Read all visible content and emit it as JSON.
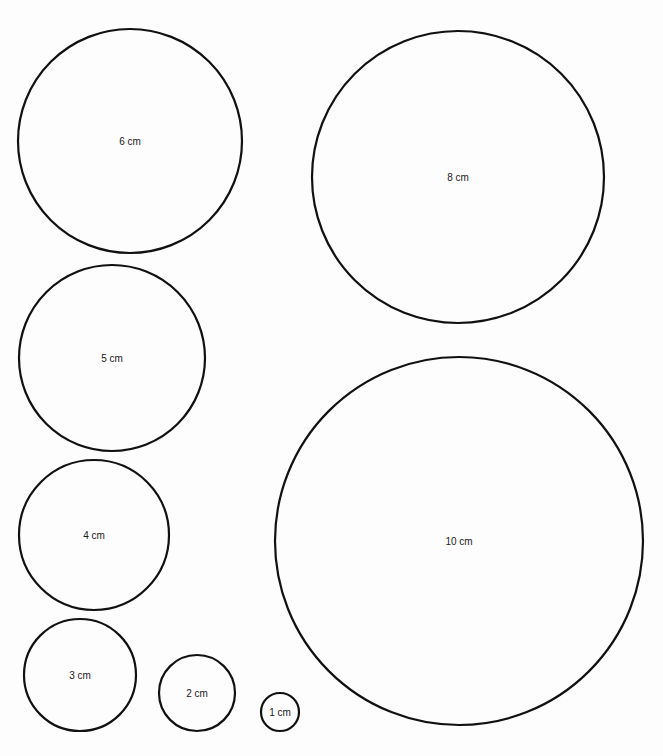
{
  "diagram": {
    "title": "",
    "stroke_color": "#111111",
    "background": "#fdfdfd",
    "circles": [
      {
        "label": "6 cm",
        "diameter_cm": 6,
        "cx": 130,
        "cy": 141,
        "r": 112
      },
      {
        "label": "8 cm",
        "diameter_cm": 8,
        "cx": 458,
        "cy": 177,
        "r": 146
      },
      {
        "label": "5 cm",
        "diameter_cm": 5,
        "cx": 112,
        "cy": 358,
        "r": 93
      },
      {
        "label": "10 cm",
        "diameter_cm": 10,
        "cx": 459,
        "cy": 541,
        "r": 184
      },
      {
        "label": "4 cm",
        "diameter_cm": 4,
        "cx": 94,
        "cy": 535,
        "r": 75
      },
      {
        "label": "3 cm",
        "diameter_cm": 3,
        "cx": 80,
        "cy": 675,
        "r": 56
      },
      {
        "label": "2 cm",
        "diameter_cm": 2,
        "cx": 197,
        "cy": 693,
        "r": 38
      },
      {
        "label": "1 cm",
        "diameter_cm": 1,
        "cx": 280,
        "cy": 712,
        "r": 19
      }
    ]
  }
}
